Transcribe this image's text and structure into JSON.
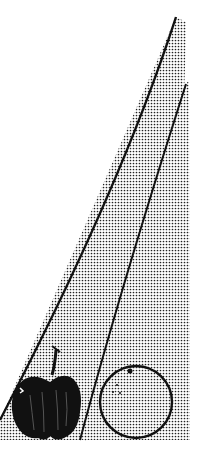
{
  "illustration": {
    "subject": "apple and orange with two halftone wedge shapes",
    "objects": [
      {
        "name": "apple",
        "fill": "#111111"
      },
      {
        "name": "orange",
        "stroke": "#111111"
      }
    ],
    "colors": {
      "background": "#ffffff",
      "ink": "#111111",
      "halftone_dot": "#222222"
    }
  }
}
